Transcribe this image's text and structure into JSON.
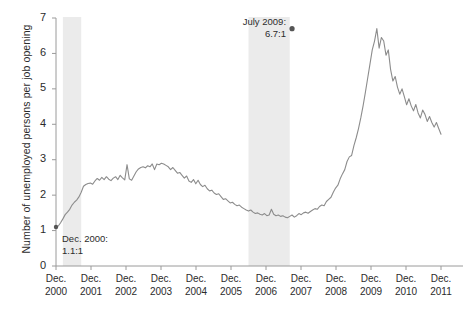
{
  "chart_data": {
    "type": "line",
    "title": "",
    "subtitle": "",
    "xlabel": "",
    "ylabel": "Number of unemployed persons per job opening",
    "ylim": [
      0,
      7
    ],
    "yticks": [
      0,
      1,
      2,
      3,
      4,
      5,
      6,
      7
    ],
    "ytick_labels": [
      "0",
      "1",
      "2",
      "3",
      "4",
      "5",
      "6",
      "7"
    ],
    "grid": false,
    "legend": "none",
    "line_color": "#8c8c8c",
    "marker_color": "#555555",
    "band_color": "#ebebeb",
    "axis_color": "#9a9a9a",
    "xtick_labels": [
      {
        "month": "Dec.",
        "year": "2000"
      },
      {
        "month": "Dec.",
        "year": "2001"
      },
      {
        "month": "Dec.",
        "year": "2002"
      },
      {
        "month": "Dec.",
        "year": "2003"
      },
      {
        "month": "Dec.",
        "year": "2004"
      },
      {
        "month": "Dec.",
        "year": "2005"
      },
      {
        "month": "Dec.",
        "year": "2006"
      },
      {
        "month": "Dec.",
        "year": "2007"
      },
      {
        "month": "Dec.",
        "year": "2008"
      },
      {
        "month": "Dec.",
        "year": "2009"
      },
      {
        "month": "Dec.",
        "year": "2010"
      },
      {
        "month": "Dec.",
        "year": "2011"
      }
    ],
    "x_start": "2000-12",
    "x_end": "2011-12",
    "shaded_bands": [
      {
        "label": "2001 recession",
        "start": "2001-03",
        "end": "2001-11"
      },
      {
        "label": "2007-2009 recession",
        "start": "2007-12",
        "end": "2009-06"
      }
    ],
    "annotations": [
      {
        "name": "start-point",
        "label_line1": "Dec. 2000:",
        "label_line2": "1.1:1",
        "x": "2000-12",
        "y": 1.1
      },
      {
        "name": "peak-point",
        "label_line1": "July 2009:",
        "label_line2": "6.7:1",
        "x": "2009-07",
        "y": 6.7
      }
    ],
    "series": [
      {
        "name": "Unemployed persons per job opening",
        "values": [
          1.1,
          1.13,
          1.22,
          1.33,
          1.45,
          1.52,
          1.6,
          1.72,
          1.8,
          1.86,
          1.95,
          2.08,
          2.25,
          2.3,
          2.33,
          2.34,
          2.31,
          2.4,
          2.47,
          2.42,
          2.5,
          2.44,
          2.52,
          2.45,
          2.41,
          2.48,
          2.52,
          2.44,
          2.56,
          2.49,
          2.43,
          2.86,
          2.46,
          2.42,
          2.54,
          2.66,
          2.74,
          2.78,
          2.8,
          2.77,
          2.83,
          2.8,
          2.88,
          2.72,
          2.88,
          2.86,
          2.9,
          2.88,
          2.84,
          2.8,
          2.72,
          2.78,
          2.7,
          2.62,
          2.64,
          2.56,
          2.48,
          2.54,
          2.4,
          2.36,
          2.44,
          2.32,
          2.42,
          2.3,
          2.24,
          2.28,
          2.18,
          2.12,
          2.14,
          2.06,
          2.02,
          2.04,
          1.96,
          1.88,
          1.9,
          1.84,
          1.78,
          1.8,
          1.74,
          1.7,
          1.72,
          1.66,
          1.62,
          1.58,
          1.55,
          1.58,
          1.52,
          1.48,
          1.5,
          1.46,
          1.44,
          1.48,
          1.42,
          1.44,
          1.6,
          1.46,
          1.42,
          1.44,
          1.4,
          1.42,
          1.38,
          1.36,
          1.4,
          1.44,
          1.38,
          1.42,
          1.48,
          1.45,
          1.5,
          1.52,
          1.49,
          1.54,
          1.58,
          1.62,
          1.6,
          1.68,
          1.72,
          1.7,
          1.82,
          1.88,
          1.94,
          2.08,
          2.2,
          2.28,
          2.46,
          2.6,
          2.72,
          2.95,
          3.08,
          3.12,
          3.4,
          3.62,
          3.88,
          4.18,
          4.52,
          4.9,
          5.3,
          5.7,
          6.1,
          6.35,
          6.7,
          6.15,
          6.45,
          6.35,
          5.95,
          6.1,
          5.55,
          5.22,
          5.35,
          5.05,
          4.85,
          5.0,
          4.78,
          4.55,
          4.72,
          4.52,
          4.38,
          4.56,
          4.32,
          4.18,
          4.4,
          4.28,
          4.08,
          4.22,
          4.05,
          3.92,
          4.05,
          3.88,
          3.72
        ]
      }
    ]
  }
}
